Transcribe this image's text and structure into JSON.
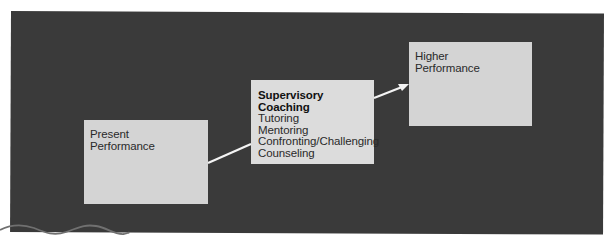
{
  "diagram": {
    "background_color": "#3a3a3a",
    "box_color": "#d4d4d4",
    "arrow_color": "#ffffff",
    "accent_wave_color": "#6a6a6a",
    "nodes": [
      {
        "id": "present",
        "lines": [
          "Present",
          "Performance"
        ]
      },
      {
        "id": "coaching",
        "title_lines": [
          "Supervisory",
          "Coaching"
        ],
        "items": [
          "Tutoring",
          "Mentoring",
          "Confronting/Challenging",
          "Counseling"
        ]
      },
      {
        "id": "higher",
        "lines": [
          "Higher",
          "Performance"
        ]
      }
    ],
    "edges": [
      {
        "from": "present",
        "to": "coaching",
        "arrowhead": false
      },
      {
        "from": "coaching",
        "to": "higher",
        "arrowhead": true
      }
    ]
  }
}
